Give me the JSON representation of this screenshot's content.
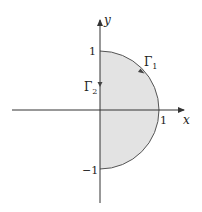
{
  "diagram": {
    "colors": {
      "fill": "#e3e3e3",
      "stroke": "#555555",
      "axis": "#333333",
      "text": "#222222"
    },
    "axes": {
      "x_label": "x",
      "y_label": "y"
    },
    "ticks": {
      "x_one": "1",
      "y_one": "1",
      "y_minus_one": "−1"
    },
    "curves": {
      "gamma1": {
        "label": "Γ",
        "subscript": "1"
      },
      "gamma2": {
        "label": "Γ",
        "subscript": "2"
      }
    }
  }
}
